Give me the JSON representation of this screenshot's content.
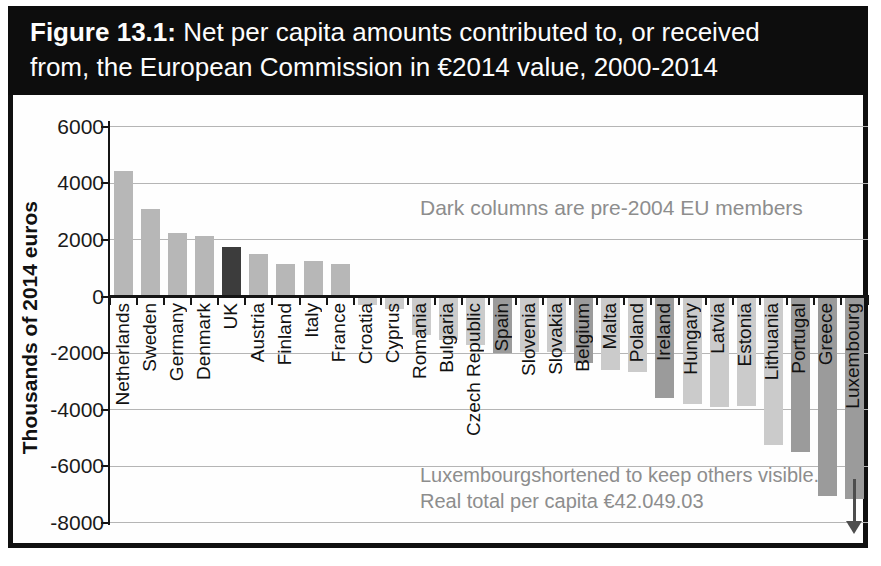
{
  "figure": {
    "title_label": "Figure 13.1:",
    "title_line1_rest": " Net per capita amounts contributed to, or received",
    "title_line2": "from, the European Commission in €2014 value, 2000-2014"
  },
  "chart_data": {
    "type": "bar",
    "title": "Net per capita amounts contributed to, or received from, the European Commission in €2014 value, 2000-2014",
    "xlabel": "",
    "ylabel": "Thousands of 2014 euros",
    "ylim": [
      -8000,
      6000
    ],
    "yticks": [
      6000,
      4000,
      2000,
      0,
      -2000,
      -4000,
      -6000,
      -8000
    ],
    "grid": true,
    "categories": [
      "Netherlands",
      "Sweden",
      "Germany",
      "Denmark",
      "UK",
      "Austria",
      "Finland",
      "Italy",
      "France",
      "Croatia",
      "Cyprus",
      "Romania",
      "Bulgaria",
      "Czech Republic",
      "Spain",
      "Slovenia",
      "Slovakia",
      "Belgium",
      "Malta",
      "Poland",
      "Ireland",
      "Hungary",
      "Latvia",
      "Estonia",
      "Lithuania",
      "Portugal",
      "Greece",
      "Luxembourg"
    ],
    "values": [
      4450,
      3100,
      2250,
      2150,
      1750,
      1500,
      1150,
      1250,
      1150,
      -250,
      -400,
      -1300,
      -1500,
      -1650,
      -1950,
      -1900,
      -1900,
      -2300,
      -2550,
      -2600,
      -3550,
      -3750,
      -3850,
      -3800,
      -5200,
      -5450,
      -7000,
      -7100
    ],
    "shades": [
      "medium",
      "medium",
      "medium",
      "medium",
      "darkest",
      "medium",
      "medium",
      "medium",
      "medium",
      "light",
      "light",
      "light",
      "light",
      "light",
      "dark",
      "light",
      "light",
      "dark",
      "light",
      "light",
      "dark",
      "light",
      "light",
      "light",
      "light",
      "dark",
      "dark",
      "dark"
    ],
    "colors": {
      "light": "#cbcbcb",
      "medium": "#b7b7b7",
      "dark": "#9b9b9b",
      "darkest": "#3c3c3c"
    },
    "luxembourg_shortened": true,
    "annotations": {
      "legend_note": "Dark columns are pre-2004 EU members",
      "lux_note_line1": "Luxembourgshortened to keep others visible.",
      "lux_note_line2": "Real total per capita €42.049.03"
    }
  }
}
